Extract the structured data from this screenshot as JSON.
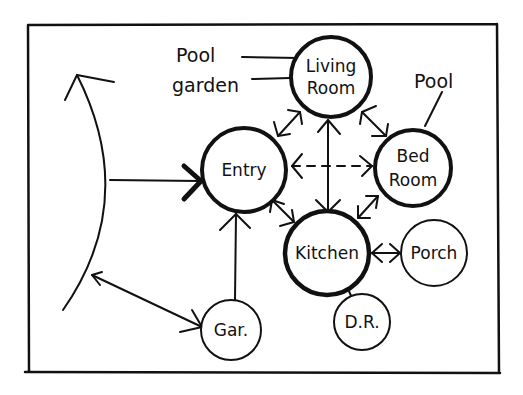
{
  "diagram": {
    "nodes": [
      {
        "id": "living",
        "line1": "Living",
        "line2": "Room"
      },
      {
        "id": "entry",
        "line1": "Entry",
        "line2": ""
      },
      {
        "id": "bed",
        "line1": "Bed",
        "line2": "Room"
      },
      {
        "id": "kitchen",
        "line1": "Kitchen",
        "line2": ""
      },
      {
        "id": "porch",
        "line1": "Porch",
        "line2": ""
      },
      {
        "id": "dr",
        "line1": "D.R.",
        "line2": ""
      },
      {
        "id": "gar",
        "line1": "Gar.",
        "line2": ""
      }
    ],
    "annotations": {
      "pool_left": "Pool",
      "garden": "garden",
      "pool_right": "Pool"
    },
    "edges": [
      {
        "from": "street",
        "to": "entry",
        "style": "solid-arrow"
      },
      {
        "from": "street",
        "to": "gar",
        "style": "double-arrow"
      },
      {
        "from": "gar",
        "to": "entry",
        "style": "arrow"
      },
      {
        "from": "entry",
        "to": "living",
        "style": "double-arrow"
      },
      {
        "from": "living",
        "to": "bed",
        "style": "double-arrow"
      },
      {
        "from": "living",
        "to": "kitchen",
        "style": "double-arrow"
      },
      {
        "from": "entry",
        "to": "bed",
        "style": "dashed-double-arrow"
      },
      {
        "from": "entry",
        "to": "kitchen",
        "style": "double-arrow"
      },
      {
        "from": "bed",
        "to": "kitchen",
        "style": "double-arrow"
      },
      {
        "from": "kitchen",
        "to": "porch",
        "style": "double-arrow"
      },
      {
        "from": "kitchen",
        "to": "dr",
        "style": "line"
      }
    ]
  }
}
